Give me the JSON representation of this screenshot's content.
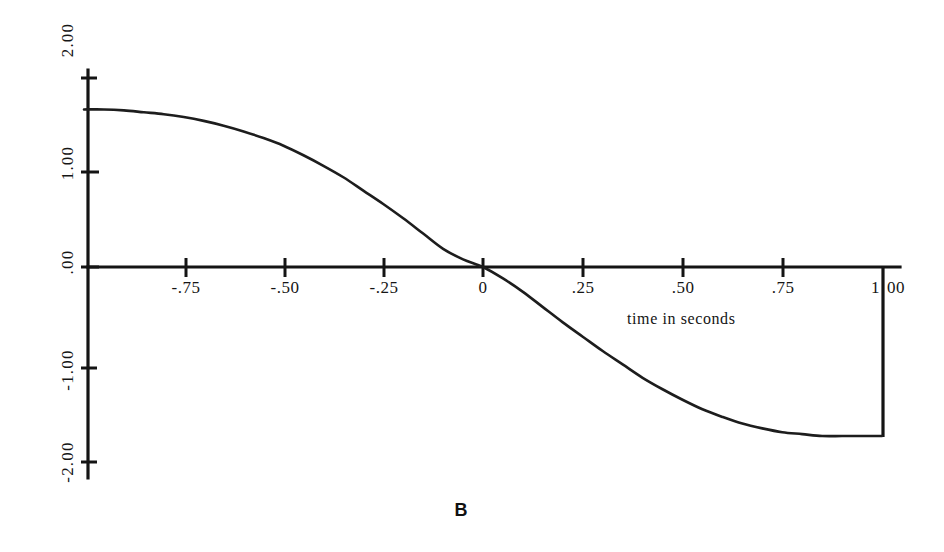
{
  "figure": {
    "caption": "B",
    "background_color": "#ffffff",
    "ink_color": "#141414"
  },
  "chart_data": {
    "type": "line",
    "title": "",
    "subtitle": "",
    "xlabel": "time in seconds",
    "ylabel": "",
    "xlim": [
      -1.0,
      1.0
    ],
    "ylim": [
      -2.0,
      2.0
    ],
    "grid": false,
    "legend": "none",
    "x_ticks": [
      {
        "value": -0.75,
        "label": "-.75"
      },
      {
        "value": -0.5,
        "label": "-.50"
      },
      {
        "value": -0.25,
        "label": "-.25"
      },
      {
        "value": 0.0,
        "label": "0"
      },
      {
        "value": 0.25,
        "label": ".25"
      },
      {
        "value": 0.5,
        "label": ".50"
      },
      {
        "value": 0.75,
        "label": ".75"
      },
      {
        "value": 1.0,
        "label": "1.00",
        "label_left": "1",
        "label_right": "00"
      }
    ],
    "y_ticks": [
      {
        "value": 2.0,
        "label": "2.00"
      },
      {
        "value": 1.0,
        "label": "1.00"
      },
      {
        "value": 0.0,
        "label": ".00"
      },
      {
        "value": -1.0,
        "label": "-1.00"
      },
      {
        "value": -2.0,
        "label": "-2.00"
      }
    ],
    "series": [
      {
        "name": "response",
        "color": "#1d1d1d",
        "x": [
          -1.0,
          -0.95,
          -0.9,
          -0.85,
          -0.8,
          -0.75,
          -0.7,
          -0.65,
          -0.6,
          -0.55,
          -0.5,
          -0.45,
          -0.4,
          -0.35,
          -0.3,
          -0.25,
          -0.2,
          -0.15,
          -0.1,
          -0.05,
          0.0,
          0.05,
          0.1,
          0.15,
          0.2,
          0.25,
          0.3,
          0.35,
          0.4,
          0.45,
          0.5,
          0.55,
          0.6,
          0.65,
          0.7,
          0.75,
          0.8,
          0.85,
          0.9,
          0.95,
          1.0
        ],
        "y": [
          1.65,
          1.65,
          1.64,
          1.62,
          1.6,
          1.57,
          1.53,
          1.48,
          1.42,
          1.35,
          1.27,
          1.17,
          1.06,
          0.94,
          0.8,
          0.66,
          0.51,
          0.35,
          0.19,
          0.08,
          0.0,
          -0.12,
          -0.26,
          -0.42,
          -0.58,
          -0.73,
          -0.88,
          -1.02,
          -1.16,
          -1.28,
          -1.39,
          -1.49,
          -1.57,
          -1.64,
          -1.69,
          -1.73,
          -1.75,
          -1.77,
          -1.77,
          -1.77,
          -1.77
        ]
      }
    ],
    "annotations": [
      {
        "name": "terminal-drop-line",
        "description": "vertical line at x = 1.00 from the zero axis down to the curve end value",
        "x": 1.0,
        "y_from": 0.0,
        "y_to": -1.77
      }
    ]
  }
}
